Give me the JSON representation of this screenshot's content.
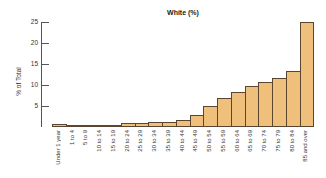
{
  "chart_data": {
    "type": "bar",
    "title": "White (%)",
    "xlabel": "",
    "ylabel": "% of Total",
    "ylim": [
      0,
      25
    ],
    "yticks": [
      5,
      10,
      15,
      20,
      25
    ],
    "grid": false,
    "bar_color": "#EEC07C",
    "bar_border": "#5a4630",
    "categories": [
      "Under 1 year",
      "1 to 4",
      "5 to 9",
      "10 to 14",
      "15 to 19",
      "20 to 24",
      "25 to 29",
      "30 to 34",
      "35 to 39",
      "40 to 44",
      "45 to 49",
      "50 to 54",
      "55 to 59",
      "60 to 64",
      "65 to 69",
      "70 to 74",
      "75 to 79",
      "80 to 84",
      "85 and over"
    ],
    "values": [
      0.8,
      0.2,
      0.1,
      0.2,
      0.5,
      0.9,
      1.0,
      1.1,
      1.2,
      1.7,
      2.8,
      4.9,
      6.9,
      8.4,
      9.7,
      10.6,
      11.6,
      13.3,
      25.1
    ]
  }
}
